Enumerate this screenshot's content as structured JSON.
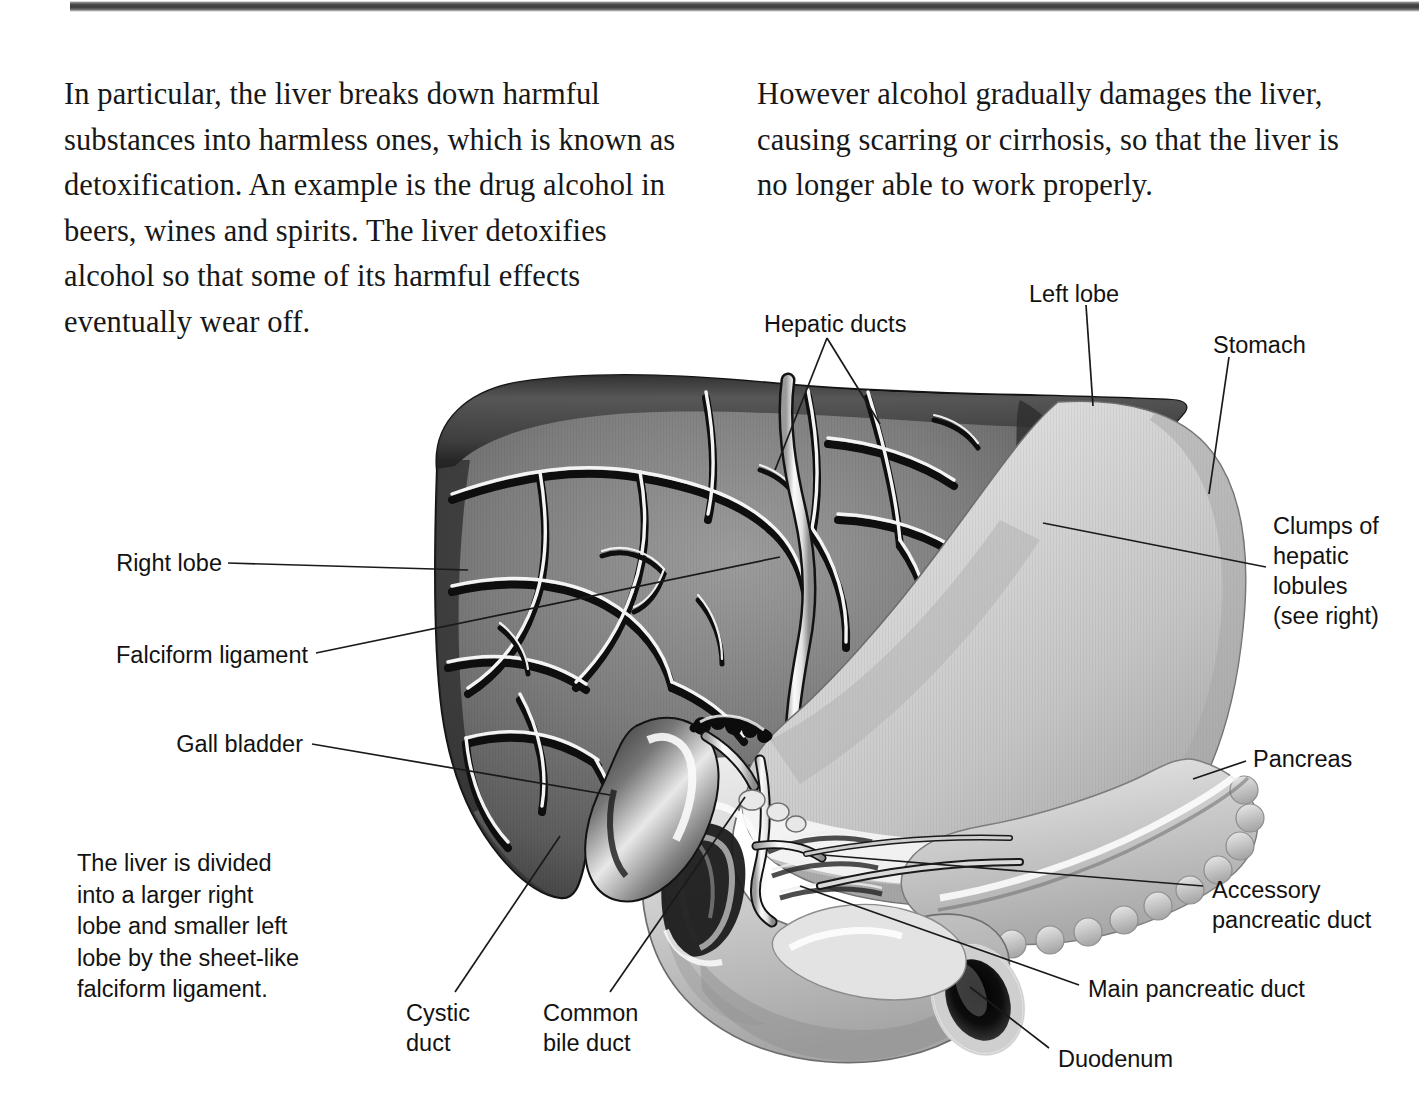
{
  "document": {
    "type": "anatomy-textbook-page",
    "topic": "The liver, gall bladder, pancreas and duodenum"
  },
  "body": {
    "left_column": "In particular, the liver breaks down harmful substances into harmless ones, which is known as detoxification. An example is the drug alcohol in beers, wines and spirits. The liver detoxifies alcohol so that some of its harmful effects eventually wear off.",
    "right_column": "However alcohol gradually damages the liver, causing scarring or cirrhosis, so that the liver is no longer able to work properly."
  },
  "caption": {
    "left_note": "The liver is divided\ninto a larger right\nlobe and smaller left\nlobe by the sheet-like\nfalciform ligament."
  },
  "labels": {
    "hepatic_ducts": "Hepatic ducts",
    "left_lobe": "Left lobe",
    "stomach": "Stomach",
    "clumps_of_hepatic_lobules": "Clumps of\nhepatic\nlobules\n(see right)",
    "right_lobe": "Right lobe",
    "falciform_ligament": "Falciform ligament",
    "gall_bladder": "Gall bladder",
    "pancreas": "Pancreas",
    "accessory_pancreatic_duct": "Accessory\npancreatic duct",
    "main_pancreatic_duct": "Main pancreatic duct",
    "duodenum": "Duodenum",
    "cystic_duct": "Cystic\nduct",
    "common_bile_duct": "Common\nbile duct"
  },
  "colors": {
    "page_background": "#ffffff",
    "text": "#121212",
    "body_text": "#171717",
    "leader_line": "#1a1a1a",
    "liver_dark": "#5e5e5e",
    "liver_mid": "#7c7c7c",
    "liver_light": "#9a9a9a",
    "liver_edge": "#1c1c1c",
    "vessel_highlight": "#f2f2f2",
    "vessel_shadow": "#101010",
    "stomach_light": "#d8d8d8",
    "stomach_mid": "#bcbcbc",
    "stomach_shadow": "#8f8f8f",
    "duodenum_light": "#d2d2d2",
    "lumen_dark": "#161616",
    "top_edge_bar": "#3c3c3c"
  }
}
